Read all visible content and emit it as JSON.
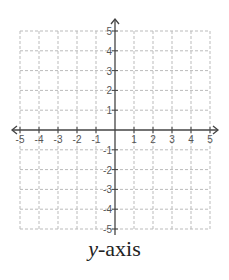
{
  "chart_data": {
    "type": "scatter",
    "title": "",
    "xlabel": "",
    "ylabel": "",
    "xlim": [
      -5,
      5
    ],
    "ylim": [
      -5,
      5
    ],
    "grid": true,
    "grid_style": "dashed",
    "x_ticks": [
      -5,
      -4,
      -3,
      -2,
      -1,
      1,
      2,
      3,
      4,
      5
    ],
    "y_ticks": [
      -5,
      -4,
      -3,
      -2,
      -1,
      1,
      2,
      3,
      4,
      5
    ],
    "axes_arrows": true,
    "series": [],
    "caption": {
      "var": "y",
      "rest": "-axis"
    }
  },
  "colors": {
    "axis": "#444444",
    "grid": "#bbbbbb",
    "tick_label": "#555555"
  }
}
